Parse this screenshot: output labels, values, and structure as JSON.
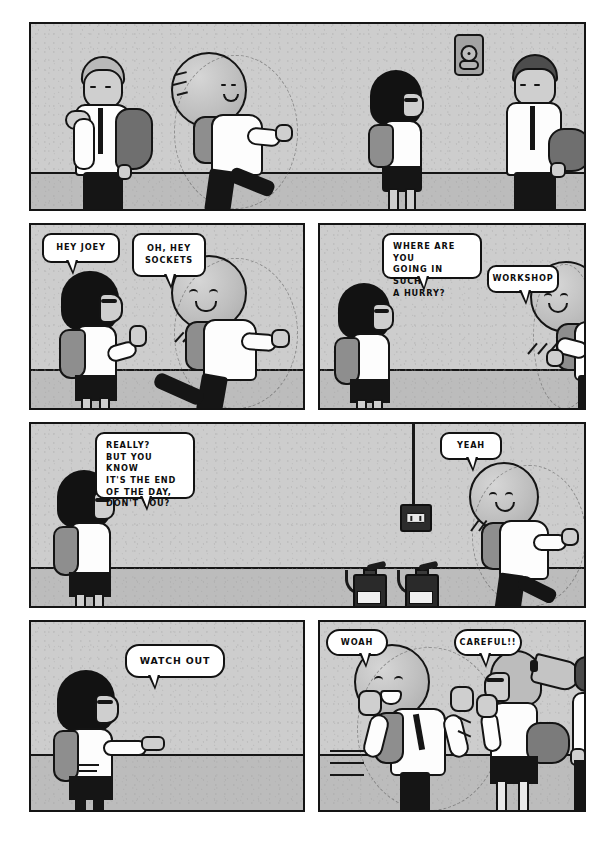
{
  "page": {
    "type": "comic-page",
    "background_color": "#ffffff",
    "panel_border_color": "#141414",
    "wall_color": "#cdcdcd",
    "floor_color": "#bcbcbc",
    "bubble_fill": "#ffffff",
    "ink_color": "#141414"
  },
  "panels": [
    {
      "id": "panel-1",
      "row": 1,
      "setting": "school corridor",
      "description": "Wide establishing shot: a boy walks left rubbing his neck, a ball-headed boy runs past him, a girl with a black bob walks right, and a man with a shoulder bag walks at far right. A fire alarm bell is mounted on the wall.",
      "bubbles": [],
      "props": [
        "fire-alarm-bell"
      ],
      "characters": [
        "walking-boy",
        "ball-head-boy-running",
        "bob-girl",
        "man-with-bag"
      ]
    },
    {
      "id": "panel-2",
      "row": 2,
      "description": "The bob-haired girl raises a hand to wave as the ball-headed boy runs past her.",
      "bubbles": [
        {
          "id": "bubble-hey-joey",
          "speaker": "bob-girl",
          "text": "HEY JOEY"
        },
        {
          "id": "bubble-oh-hey-sockets",
          "speaker": "ball-head-boy",
          "text": "OH, HEY\nSOCKETS"
        }
      ],
      "characters": [
        "bob-girl",
        "ball-head-boy-running"
      ]
    },
    {
      "id": "panel-3",
      "row": 2,
      "description": "The girl stands still and calls after the running boy, who answers over his shoulder.",
      "bubbles": [
        {
          "id": "bubble-where-are-you-going",
          "speaker": "bob-girl",
          "text": "WHERE ARE YOU\nGOING IN SUCH\nA HURRY?"
        },
        {
          "id": "bubble-workshop",
          "speaker": "ball-head-boy",
          "text": "WORKSHOP"
        }
      ],
      "characters": [
        "bob-girl",
        "ball-head-boy-running"
      ]
    },
    {
      "id": "panel-4",
      "row": 3,
      "description": "Wide panel: the girl on the left questions the ball-headed boy far to the right, who keeps running. Fire extinguishers sit on the floor and an electrical box hangs from a cable on the wall.",
      "bubbles": [
        {
          "id": "bubble-really",
          "speaker": "bob-girl",
          "text": "REALLY?\nBUT YOU KNOW\nIT'S THE END\nOF THE DAY,\nDON'T YOU?"
        },
        {
          "id": "bubble-yeah",
          "speaker": "ball-head-boy",
          "text": "YEAH"
        }
      ],
      "props": [
        "fire-extinguisher",
        "fire-extinguisher",
        "hanging-outlet-box"
      ],
      "characters": [
        "bob-girl",
        "ball-head-boy-running"
      ]
    },
    {
      "id": "panel-5",
      "row": 4,
      "description": "The girl points ahead and shouts a warning.",
      "bubbles": [
        {
          "id": "bubble-watch-out",
          "speaker": "bob-girl",
          "text": "WATCH OUT"
        }
      ],
      "characters": [
        "bob-girl-pointing"
      ]
    },
    {
      "id": "panel-6",
      "row": 4,
      "description": "The ball-headed boy skids to a stop with both arms up, nearly colliding with a ponytailed girl wearing glasses who holds her hands up defensively.",
      "bubbles": [
        {
          "id": "bubble-woah",
          "speaker": "ball-head-boy",
          "text": "WOAH"
        },
        {
          "id": "bubble-careful",
          "speaker": "ponytail-girl",
          "text": "CAREFUL!!"
        }
      ],
      "characters": [
        "ball-head-boy-stopping",
        "ponytail-girl",
        "passerby-arm"
      ]
    }
  ],
  "characters": {
    "ball_head_boy": {
      "name": "JOEY",
      "note": "boy whose head is a large sphere"
    },
    "bob_girl": {
      "name": "SOCKETS",
      "note": "girl with black bob and glasses"
    }
  }
}
